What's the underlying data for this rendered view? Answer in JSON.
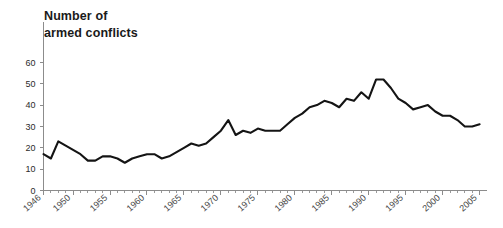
{
  "chart_data": {
    "type": "line",
    "title": "Number of\narmed conflicts",
    "title_line1": "Number of",
    "title_line2": "armed conflicts",
    "xlabel": "",
    "ylabel": "",
    "xlim": [
      1946,
      2006
    ],
    "ylim": [
      0,
      65
    ],
    "grid": false,
    "legend": false,
    "legend_position": "none",
    "line_color": "#141414",
    "axis_color": "#8c8c8c",
    "background_color": "#ffffff",
    "ytick_labels": [
      "0",
      "10",
      "20",
      "30",
      "40",
      "50",
      "60"
    ],
    "ytick_values": [
      0,
      10,
      20,
      30,
      40,
      50,
      60
    ],
    "xtick_labels": [
      "1946",
      "1950",
      "1955",
      "1960",
      "1965",
      "1970",
      "1975",
      "1980",
      "1985",
      "1990",
      "1995",
      "2000",
      "2005"
    ],
    "xtick_values": [
      1946,
      1950,
      1955,
      1960,
      1965,
      1970,
      1975,
      1980,
      1985,
      1990,
      1995,
      2000,
      2005
    ],
    "xtick_minor_step": 1,
    "series": [
      {
        "name": "Number of armed conflicts",
        "x": [
          1946,
          1947,
          1948,
          1949,
          1950,
          1951,
          1952,
          1953,
          1954,
          1955,
          1956,
          1957,
          1958,
          1959,
          1960,
          1961,
          1962,
          1963,
          1964,
          1965,
          1966,
          1967,
          1968,
          1969,
          1970,
          1971,
          1972,
          1973,
          1974,
          1975,
          1976,
          1977,
          1978,
          1979,
          1980,
          1981,
          1982,
          1983,
          1984,
          1985,
          1986,
          1987,
          1988,
          1989,
          1990,
          1991,
          1992,
          1993,
          1994,
          1995,
          1996,
          1997,
          1998,
          1999,
          2000,
          2001,
          2002,
          2003,
          2004,
          2005
        ],
        "values": [
          17,
          15,
          23,
          21,
          19,
          17,
          14,
          14,
          16,
          16,
          15,
          13,
          15,
          16,
          17,
          17,
          15,
          16,
          18,
          20,
          22,
          21,
          22,
          25,
          28,
          33,
          26,
          28,
          27,
          29,
          28,
          28,
          28,
          31,
          34,
          36,
          39,
          40,
          42,
          41,
          39,
          43,
          42,
          46,
          43,
          52,
          52,
          48,
          43,
          41,
          38,
          39,
          40,
          37,
          35,
          35,
          33,
          30,
          30,
          31
        ]
      }
    ]
  }
}
